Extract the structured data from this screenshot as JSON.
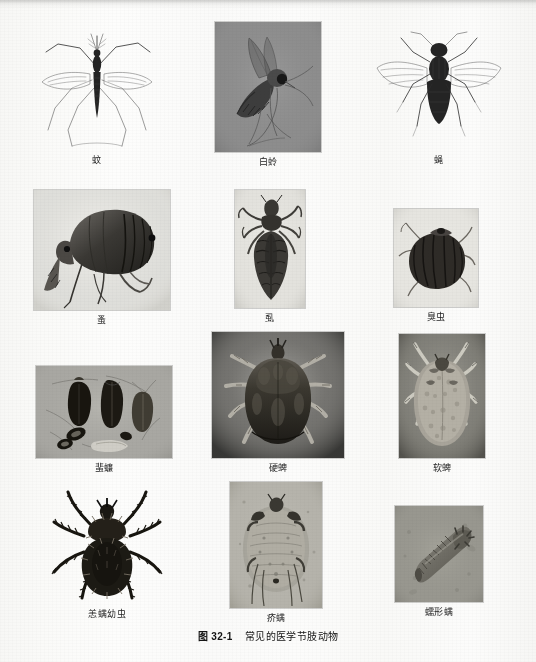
{
  "figure": {
    "number": "图 32-1",
    "title": "常见的医学节肢动物",
    "caption_full": "图 32-1　常见的医学节肢动物"
  },
  "grid": {
    "columns": 3,
    "rows": 4,
    "total_plates": 12
  },
  "plates": [
    {
      "id": "mosquito",
      "label": "蚊",
      "row": 1,
      "column": 1,
      "style": "line-drawing",
      "background": "#fbfbfa",
      "framed": false
    },
    {
      "id": "sandfly",
      "label": "白蛉",
      "row": 1,
      "column": 2,
      "style": "photograph",
      "background": "#8d8d8d",
      "framed": true
    },
    {
      "id": "fly",
      "label": "蝇",
      "row": 1,
      "column": 3,
      "style": "line-drawing",
      "background": "#fbfbfa",
      "framed": false
    },
    {
      "id": "flea",
      "label": "蚤",
      "row": 2,
      "column": 1,
      "style": "photograph",
      "background": "#ebeae6",
      "framed": true
    },
    {
      "id": "louse",
      "label": "虱",
      "row": 2,
      "column": 2,
      "style": "photograph",
      "background": "#e6e5e0",
      "framed": true
    },
    {
      "id": "bedbug",
      "label": "臭虫",
      "row": 2,
      "column": 3,
      "style": "photograph",
      "background": "#e9e8e3",
      "framed": true
    },
    {
      "id": "cockroach",
      "label": "蜚蠊",
      "row": 3,
      "column": 1,
      "style": "photograph",
      "background": "#a9a8a4",
      "framed": true
    },
    {
      "id": "hard-tick",
      "label": "硬蜱",
      "row": 3,
      "column": 2,
      "style": "photograph",
      "background": "#7a7a78",
      "framed": true
    },
    {
      "id": "soft-tick",
      "label": "软蜱",
      "row": 3,
      "column": 3,
      "style": "photograph",
      "background": "#87867f",
      "framed": true
    },
    {
      "id": "chigger-larva",
      "label": "恙螨幼虫",
      "row": 4,
      "column": 1,
      "style": "photograph",
      "background": "#fbfbfa",
      "framed": false
    },
    {
      "id": "scabies-mite",
      "label": "疥螨",
      "row": 4,
      "column": 2,
      "style": "photomicrograph",
      "background": "#b6b4ad",
      "framed": true
    },
    {
      "id": "demodex-mite",
      "label": "蠕形螨",
      "row": 4,
      "column": 3,
      "style": "photomicrograph",
      "background": "#9a9992",
      "framed": true
    }
  ]
}
